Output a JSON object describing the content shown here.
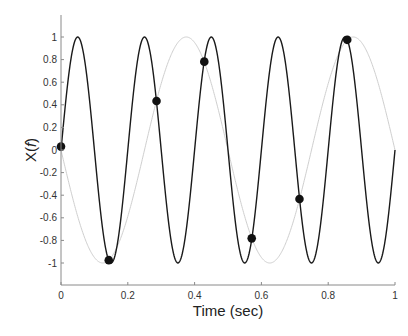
{
  "chart_data": {
    "type": "line",
    "title": "",
    "xlabel": "Time (sec)",
    "ylabel": "X(f)",
    "xlim": [
      0,
      1
    ],
    "ylim": [
      -1.2,
      1.2
    ],
    "grid": false,
    "legend": null,
    "xticks": [
      0,
      0.2,
      0.4,
      0.6,
      0.8,
      1
    ],
    "xtick_labels": [
      "0",
      "0.2",
      "0.4",
      "0.6",
      "0.8",
      "1"
    ],
    "yticks": [
      1,
      0.8,
      0.6,
      0.4,
      0.2,
      0,
      -0.2,
      -0.4,
      -0.6,
      -0.8,
      -1
    ],
    "ytick_labels": [
      "1",
      "0.8",
      "0.6",
      "0.4",
      "0.2",
      "0",
      "-0.2",
      "-0.4",
      "-0.6",
      "-0.8",
      "-1"
    ],
    "series": [
      {
        "name": "5 Hz sine",
        "kind": "line",
        "function": "sin(2*pi*5*t)",
        "frequency": 5,
        "sign": 1,
        "color": "#1a1a1a",
        "width": 1.4
      },
      {
        "name": "2 Hz alias",
        "kind": "line",
        "function": "-sin(2*pi*2*t)",
        "frequency": 2,
        "sign": -1,
        "color": "#cfcfcf",
        "width": 1.0
      },
      {
        "name": "samples",
        "kind": "scatter",
        "color": "#111111",
        "x": [
          0,
          0.143,
          0.286,
          0.429,
          0.571,
          0.714,
          0.857
        ],
        "y": [
          0.03,
          -0.975,
          0.434,
          0.782,
          -0.782,
          -0.434,
          0.975
        ]
      }
    ]
  },
  "colors": {
    "axis": "#8a8a8a",
    "text": "#333333"
  }
}
